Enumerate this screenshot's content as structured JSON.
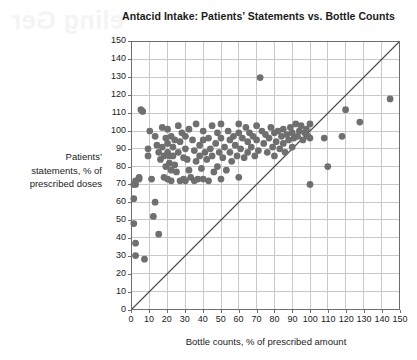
{
  "page": {
    "bleed_through_text": "eling Ger"
  },
  "chart_data": {
    "type": "scatter",
    "title": "Antacid Intake: Patients’ Statements vs. Bottle Counts",
    "xlabel": "Bottle counts, % of prescribed amount",
    "ylabel": "Patients’ statements, % of prescribed doses",
    "ylabel_lines": [
      "Patients’",
      "statements, % of",
      "prescribed doses"
    ],
    "xlim": [
      0,
      150
    ],
    "ylim": [
      0,
      150
    ],
    "xticks": [
      0,
      10,
      20,
      30,
      40,
      50,
      60,
      70,
      80,
      90,
      100,
      110,
      120,
      130,
      140,
      150
    ],
    "yticks": [
      0,
      10,
      20,
      30,
      40,
      50,
      60,
      70,
      80,
      90,
      100,
      110,
      120,
      130,
      140,
      150
    ],
    "grid": true,
    "legend": null,
    "annotations": [
      {
        "type": "reference-line",
        "label": "y = x identity line",
        "from": [
          0,
          0
        ],
        "to": [
          150,
          150
        ]
      }
    ],
    "marker": {
      "shape": "circle",
      "color": "#6f6f6f",
      "size": 4.6
    },
    "points": [
      [
        1,
        70
      ],
      [
        2,
        70
      ],
      [
        2,
        72
      ],
      [
        1,
        62
      ],
      [
        1,
        48
      ],
      [
        2,
        37
      ],
      [
        2,
        30
      ],
      [
        4,
        73
      ],
      [
        4,
        74
      ],
      [
        5,
        112
      ],
      [
        6,
        111
      ],
      [
        7,
        28
      ],
      [
        9,
        90
      ],
      [
        9,
        86
      ],
      [
        10,
        100
      ],
      [
        11,
        73
      ],
      [
        12,
        52
      ],
      [
        13,
        97
      ],
      [
        13,
        60
      ],
      [
        14,
        92
      ],
      [
        15,
        88
      ],
      [
        15,
        42
      ],
      [
        16,
        84
      ],
      [
        17,
        102
      ],
      [
        17,
        91
      ],
      [
        18,
        86
      ],
      [
        18,
        74
      ],
      [
        19,
        96
      ],
      [
        19,
        80
      ],
      [
        20,
        101
      ],
      [
        20,
        93
      ],
      [
        20,
        88
      ],
      [
        20,
        73
      ],
      [
        21,
        86
      ],
      [
        21,
        82
      ],
      [
        22,
        97
      ],
      [
        22,
        78
      ],
      [
        22,
        72
      ],
      [
        23,
        91
      ],
      [
        23,
        86
      ],
      [
        24,
        95
      ],
      [
        24,
        81
      ],
      [
        25,
        77
      ],
      [
        26,
        103
      ],
      [
        26,
        88
      ],
      [
        27,
        94
      ],
      [
        27,
        72
      ],
      [
        28,
        99
      ],
      [
        29,
        85
      ],
      [
        29,
        73
      ],
      [
        30,
        97
      ],
      [
        30,
        90
      ],
      [
        30,
        72
      ],
      [
        31,
        84
      ],
      [
        32,
        101
      ],
      [
        32,
        78
      ],
      [
        33,
        74
      ],
      [
        34,
        95
      ],
      [
        35,
        89
      ],
      [
        35,
        72
      ],
      [
        36,
        104
      ],
      [
        36,
        83
      ],
      [
        37,
        73
      ],
      [
        38,
        92
      ],
      [
        38,
        86
      ],
      [
        39,
        79
      ],
      [
        40,
        100
      ],
      [
        40,
        95
      ],
      [
        40,
        73
      ],
      [
        41,
        88
      ],
      [
        42,
        84
      ],
      [
        43,
        96
      ],
      [
        43,
        72
      ],
      [
        44,
        90
      ],
      [
        45,
        103
      ],
      [
        45,
        86
      ],
      [
        46,
        77
      ],
      [
        47,
        93
      ],
      [
        48,
        99
      ],
      [
        48,
        80
      ],
      [
        49,
        88
      ],
      [
        50,
        104
      ],
      [
        50,
        96
      ],
      [
        50,
        73
      ],
      [
        51,
        85
      ],
      [
        52,
        91
      ],
      [
        53,
        78
      ],
      [
        54,
        100
      ],
      [
        55,
        95
      ],
      [
        55,
        88
      ],
      [
        56,
        83
      ],
      [
        57,
        97
      ],
      [
        58,
        92
      ],
      [
        59,
        86
      ],
      [
        60,
        104
      ],
      [
        60,
        99
      ],
      [
        60,
        74
      ],
      [
        61,
        90
      ],
      [
        62,
        96
      ],
      [
        63,
        85
      ],
      [
        64,
        102
      ],
      [
        65,
        94
      ],
      [
        65,
        88
      ],
      [
        66,
        99
      ],
      [
        67,
        91
      ],
      [
        68,
        97
      ],
      [
        69,
        86
      ],
      [
        70,
        103
      ],
      [
        70,
        95
      ],
      [
        71,
        89
      ],
      [
        72,
        130
      ],
      [
        73,
        100
      ],
      [
        74,
        93
      ],
      [
        75,
        98
      ],
      [
        76,
        88
      ],
      [
        77,
        96
      ],
      [
        78,
        102
      ],
      [
        79,
        91
      ],
      [
        80,
        99
      ],
      [
        80,
        86
      ],
      [
        81,
        94
      ],
      [
        82,
        100
      ],
      [
        83,
        90
      ],
      [
        84,
        97
      ],
      [
        85,
        101
      ],
      [
        85,
        93
      ],
      [
        86,
        88
      ],
      [
        87,
        98
      ],
      [
        88,
        95
      ],
      [
        89,
        102
      ],
      [
        90,
        99
      ],
      [
        90,
        91
      ],
      [
        91,
        96
      ],
      [
        92,
        104
      ],
      [
        93,
        97
      ],
      [
        94,
        100
      ],
      [
        95,
        103
      ],
      [
        96,
        95
      ],
      [
        97,
        99
      ],
      [
        98,
        101
      ],
      [
        99,
        97
      ],
      [
        100,
        104
      ],
      [
        100,
        96
      ],
      [
        100,
        70
      ],
      [
        108,
        96
      ],
      [
        110,
        80
      ],
      [
        118,
        97
      ],
      [
        120,
        112
      ],
      [
        128,
        105
      ],
      [
        145,
        118
      ]
    ]
  }
}
